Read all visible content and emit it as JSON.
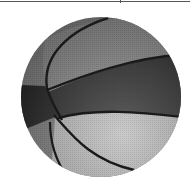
{
  "image": {
    "subject": "basketball",
    "description": "Grayscale photograph of a basketball with dark seams",
    "colors": {
      "dark_panel": "#2a2a2a",
      "mid_panel": "#7c7c7c",
      "light_panel": "#b9b9b9",
      "seam": "#1a1a1a",
      "background": "#ffffff",
      "frame_line": "#555555"
    }
  }
}
